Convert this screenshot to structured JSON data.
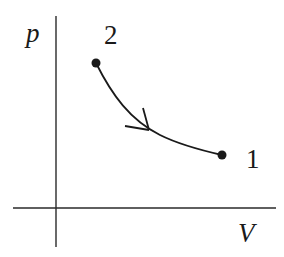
{
  "diagram": {
    "type": "pV-diagram",
    "axes": {
      "y_label": "p",
      "x_label": "V"
    },
    "points": [
      {
        "id": "2",
        "label": "2"
      },
      {
        "id": "1",
        "label": "1"
      }
    ],
    "process": {
      "from": "2",
      "to": "1",
      "direction": "from 2 to 1",
      "arrow_icon": "arrowhead-icon"
    },
    "colors": {
      "ink": "#1a1a1a",
      "background": "#ffffff"
    }
  }
}
